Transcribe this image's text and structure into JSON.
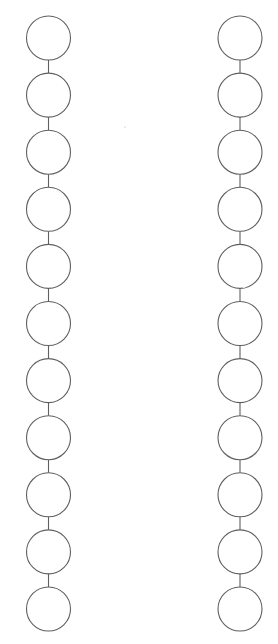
{
  "diagram": {
    "type": "two-column-node-chains",
    "width": 278,
    "height": 644,
    "colors": {
      "background": "#ffffff",
      "stroke": "#5f5f5f"
    },
    "node_radius": 22,
    "first_node_y": 38,
    "node_spacing": 57.1,
    "columns": [
      {
        "name": "left-chain",
        "center_x": 48.5,
        "node_count": 11,
        "nodes": [
          "",
          "",
          "",
          "",
          "",
          "",
          "",
          "",
          "",
          "",
          ""
        ]
      },
      {
        "name": "right-chain",
        "center_x": 240,
        "node_count": 11,
        "nodes": [
          "",
          "",
          "",
          "",
          "",
          "",
          "",
          "",
          "",
          "",
          ""
        ]
      }
    ]
  }
}
